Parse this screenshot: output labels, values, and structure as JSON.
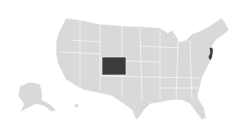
{
  "map": {
    "title": "United States",
    "base_color": "#d9d9d9",
    "highlight_color": "#3b3b3b",
    "border_color": "#ffffff",
    "background": "#ffffff",
    "highlighted_states": [
      "Colorado",
      "New Jersey"
    ]
  }
}
